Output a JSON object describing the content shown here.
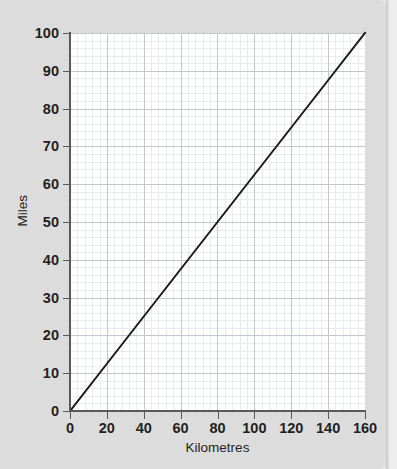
{
  "figure": {
    "background_color": "#dcdcdc",
    "plot_background_color": "#ffffff",
    "page_edge_color": "#eeeeee"
  },
  "chart_data": {
    "type": "line",
    "title": "",
    "subtitle": "",
    "xlabel": "Kilometres",
    "ylabel": "Miles",
    "xlim": [
      0,
      160
    ],
    "ylim": [
      0,
      100
    ],
    "xticks": [
      0,
      20,
      40,
      60,
      80,
      100,
      120,
      140,
      160
    ],
    "yticks": [
      0,
      10,
      20,
      30,
      40,
      50,
      60,
      70,
      80,
      90,
      100
    ],
    "xtick_labels": [
      "0",
      "20",
      "40",
      "60",
      "80",
      "100",
      "120",
      "140",
      "160"
    ],
    "ytick_labels": [
      "0",
      "10",
      "20",
      "30",
      "40",
      "50",
      "60",
      "70",
      "80",
      "90",
      "100"
    ],
    "x_minor_step": 4,
    "y_minor_step": 2,
    "grid": true,
    "grid_major_color": "#c2c7cc",
    "grid_minor_color": "#e9ecef",
    "legend": false,
    "legend_position": "none",
    "annotations": [],
    "series": [
      {
        "name": "Kilometres to Miles conversion",
        "color": "#1a1a1a",
        "line_width": 2,
        "marker": "none",
        "x": [
          0,
          20,
          40,
          60,
          80,
          100,
          120,
          140,
          160
        ],
        "values": [
          0,
          12.5,
          25,
          37.5,
          50,
          62.5,
          75,
          87.5,
          100
        ]
      }
    ]
  }
}
